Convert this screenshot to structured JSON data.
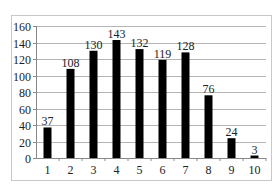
{
  "chart_data": {
    "type": "bar",
    "title": "",
    "xlabel": "",
    "ylabel": "",
    "categories": [
      "1",
      "2",
      "3",
      "4",
      "5",
      "6",
      "7",
      "8",
      "9",
      "10"
    ],
    "values": [
      37,
      108,
      130,
      143,
      132,
      119,
      128,
      76,
      24,
      3
    ],
    "data_labels": [
      "37",
      "108",
      "130",
      "143",
      "132",
      "119",
      "128",
      "76",
      "24",
      "3"
    ],
    "ylim": [
      0,
      160
    ],
    "yticks": [
      0,
      20,
      40,
      60,
      80,
      100,
      120,
      140,
      160
    ],
    "ytick_labels": [
      "0",
      "20",
      "40",
      "60",
      "80",
      "100",
      "120",
      "140",
      "160"
    ],
    "grid": true,
    "legend": null,
    "bar_color": "#000000",
    "grid_color": "#b4b4b4"
  }
}
